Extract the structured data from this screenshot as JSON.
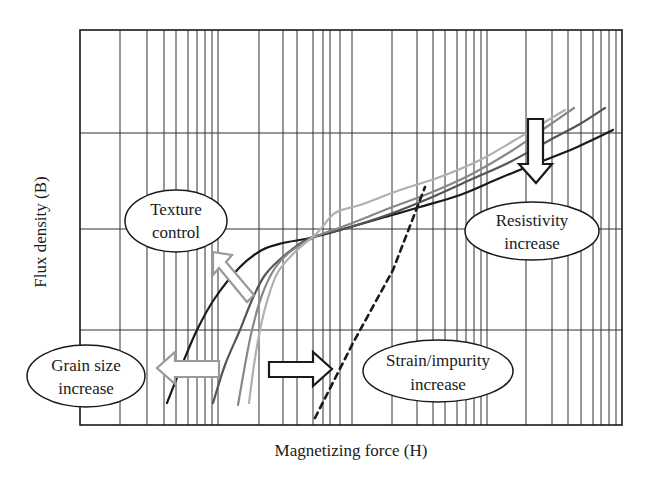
{
  "chart_data": {
    "type": "line",
    "title": "",
    "xlabel": "Magnetizing force (H)",
    "ylabel": "Flux density (B)",
    "x_scale": "log",
    "y_scale": "linear",
    "grid": true,
    "legend": null,
    "ticks_labeled": false,
    "series": [
      {
        "name": "curve-black",
        "color": "#1a1a1a",
        "style": "solid",
        "points_px": [
          [
            167,
            403
          ],
          [
            182,
            365
          ],
          [
            197,
            330
          ],
          [
            215,
            298
          ],
          [
            240,
            267
          ],
          [
            262,
            250
          ],
          [
            283,
            243
          ],
          [
            310,
            238
          ],
          [
            347,
            228
          ],
          [
            385,
            217
          ],
          [
            420,
            207
          ],
          [
            460,
            195
          ],
          [
            500,
            178
          ],
          [
            540,
            162
          ],
          [
            575,
            148
          ],
          [
            613,
            130
          ]
        ]
      },
      {
        "name": "curve-dark-gray",
        "color": "#555555",
        "style": "solid",
        "points_px": [
          [
            213,
            403
          ],
          [
            225,
            365
          ],
          [
            240,
            330
          ],
          [
            252,
            300
          ],
          [
            265,
            275
          ],
          [
            285,
            255
          ],
          [
            310,
            238
          ],
          [
            347,
            228
          ],
          [
            390,
            214
          ],
          [
            430,
            198
          ],
          [
            470,
            180
          ],
          [
            510,
            162
          ],
          [
            550,
            140
          ],
          [
            580,
            124
          ],
          [
            605,
            108
          ]
        ]
      },
      {
        "name": "curve-medium-gray",
        "color": "#888888",
        "style": "solid",
        "points_px": [
          [
            238,
            405
          ],
          [
            245,
            365
          ],
          [
            252,
            330
          ],
          [
            262,
            295
          ],
          [
            275,
            268
          ],
          [
            290,
            252
          ],
          [
            315,
            237
          ],
          [
            347,
            225
          ],
          [
            390,
            208
          ],
          [
            430,
            193
          ],
          [
            470,
            175
          ],
          [
            510,
            152
          ],
          [
            545,
            128
          ],
          [
            574,
            108
          ]
        ]
      },
      {
        "name": "curve-light-gray",
        "color": "#b0b0b0",
        "style": "solid",
        "points_px": [
          [
            249,
            403
          ],
          [
            254,
            365
          ],
          [
            260,
            330
          ],
          [
            268,
            298
          ],
          [
            278,
            272
          ],
          [
            295,
            252
          ],
          [
            318,
            232
          ],
          [
            335,
            213
          ],
          [
            360,
            205
          ],
          [
            400,
            190
          ],
          [
            440,
            177
          ],
          [
            480,
            160
          ],
          [
            515,
            140
          ],
          [
            545,
            122
          ],
          [
            565,
            110
          ]
        ]
      },
      {
        "name": "strain-impurity-line",
        "color": "#1a1a1a",
        "style": "dashed",
        "points_px": [
          [
            315,
            418
          ],
          [
            353,
            343
          ],
          [
            393,
            270
          ],
          [
            425,
            187
          ]
        ]
      }
    ],
    "annotations": [
      {
        "text": [
          "Texture",
          "control"
        ],
        "shape": "ellipse",
        "cx": 176,
        "cy": 221,
        "rx": 51,
        "ry": 31
      },
      {
        "text": [
          "Resistivity",
          "increase"
        ],
        "shape": "ellipse",
        "cx": 532,
        "cy": 231,
        "rx": 67,
        "ry": 29
      },
      {
        "text": [
          "Strain/impurity",
          "increase"
        ],
        "shape": "ellipse",
        "cx": 438,
        "cy": 371,
        "rx": 75,
        "ry": 31
      },
      {
        "text": [
          "Grain size",
          "increase"
        ],
        "shape": "ellipse",
        "cx": 86,
        "cy": 376,
        "rx": 59,
        "ry": 31
      }
    ],
    "arrows": [
      {
        "name": "texture-control-arrow",
        "direction": "up-left",
        "color": "#999999"
      },
      {
        "name": "grain-size-arrow",
        "direction": "left",
        "color": "#999999"
      },
      {
        "name": "strain-impurity-arrow",
        "direction": "right",
        "color": "#1a1a1a"
      },
      {
        "name": "resistivity-arrow",
        "direction": "down",
        "color": "#1a1a1a"
      }
    ]
  },
  "plot": {
    "left": 80,
    "top": 30,
    "right": 622,
    "bottom": 425,
    "v_grid": [
      120,
      147,
      164,
      176,
      188,
      197,
      205,
      212,
      218,
      259,
      283,
      297,
      313,
      323,
      330,
      340,
      352,
      392,
      417,
      433,
      445,
      457,
      466,
      474,
      481,
      487,
      526,
      552,
      568,
      581,
      593,
      601,
      609,
      616
    ],
    "h_grid": [
      133,
      229,
      330
    ]
  },
  "labels": {
    "xlabel": "Magnetizing force (H)",
    "ylabel": "Flux density (B)",
    "texture_1": "Texture",
    "texture_2": "control",
    "resistivity_1": "Resistivity",
    "resistivity_2": "increase",
    "strain_1": "Strain/impurity",
    "strain_2": "increase",
    "grain_1": "Grain size",
    "grain_2": "increase"
  }
}
